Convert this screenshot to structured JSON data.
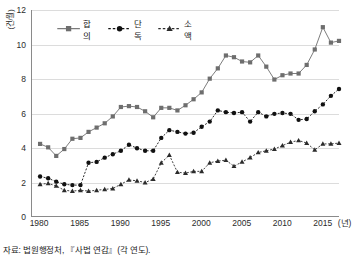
{
  "ylabel": "(건/월)",
  "source_note": "자료: 법원행정처, 『사법 연감』(각 연도).",
  "xunit": "(년)",
  "legend": {
    "items": [
      {
        "label": "합의",
        "color": "#6e6e6e",
        "marker": "square",
        "dash": "solid"
      },
      {
        "label": "단독",
        "color": "#111111",
        "marker": "circle",
        "dash": "dashed"
      },
      {
        "label": "소액",
        "color": "#2b2b2b",
        "marker": "triangle",
        "dash": "dashed"
      }
    ]
  },
  "axes": {
    "ytick_labels": [
      "12",
      "10",
      "8",
      "6",
      "4",
      "2",
      "0"
    ],
    "xtick_labels": [
      "1980",
      "1985",
      "1990",
      "1995",
      "2000",
      "2005",
      "2010",
      "2015"
    ]
  },
  "chart_data": {
    "type": "line",
    "title": "",
    "xlabel": "(년)",
    "ylabel": "(건/월)",
    "xlim": [
      1979,
      2017
    ],
    "ylim": [
      0,
      12
    ],
    "xticks": [
      1980,
      1985,
      1990,
      1995,
      2000,
      2005,
      2010,
      2015
    ],
    "yticks": [
      0,
      2,
      4,
      6,
      8,
      10,
      12
    ],
    "grid": "horizontal",
    "legend_position": "top-left-inside",
    "x": [
      1980,
      1981,
      1982,
      1983,
      1984,
      1985,
      1986,
      1987,
      1988,
      1989,
      1990,
      1991,
      1992,
      1993,
      1994,
      1995,
      1996,
      1997,
      1998,
      1999,
      2000,
      2001,
      2002,
      2003,
      2004,
      2005,
      2006,
      2007,
      2008,
      2009,
      2010,
      2011,
      2012,
      2013,
      2014,
      2015,
      2016,
      2017
    ],
    "series": [
      {
        "name": "합의",
        "color": "#6e6e6e",
        "marker": "square",
        "dash": "solid",
        "values": [
          4.2,
          4.0,
          3.5,
          3.9,
          4.5,
          4.55,
          4.9,
          5.15,
          5.4,
          5.8,
          6.35,
          6.4,
          6.35,
          6.1,
          5.75,
          6.3,
          6.3,
          6.15,
          6.45,
          6.8,
          7.2,
          8.0,
          8.6,
          9.35,
          9.25,
          9.0,
          8.95,
          9.35,
          8.7,
          7.95,
          8.2,
          8.3,
          8.3,
          8.8,
          9.7,
          11.0,
          10.1,
          10.2
        ]
      },
      {
        "name": "단독",
        "color": "#111111",
        "marker": "circle",
        "dash": "dashed",
        "values": [
          2.3,
          2.2,
          2.0,
          1.85,
          1.8,
          1.8,
          3.1,
          3.15,
          3.4,
          3.6,
          3.8,
          4.15,
          3.95,
          3.8,
          3.8,
          4.55,
          5.0,
          4.9,
          4.8,
          4.85,
          5.2,
          5.5,
          6.15,
          6.05,
          6.0,
          6.05,
          5.5,
          6.05,
          5.8,
          5.95,
          6.0,
          5.95,
          5.6,
          5.65,
          6.1,
          6.5,
          7.0,
          7.4
        ]
      },
      {
        "name": "소액",
        "color": "#2b2b2b",
        "marker": "triangle",
        "dash": "dashed",
        "values": [
          1.85,
          1.9,
          1.75,
          1.5,
          1.45,
          1.5,
          1.45,
          1.5,
          1.55,
          1.6,
          1.85,
          2.1,
          2.05,
          1.95,
          2.15,
          3.1,
          3.55,
          2.55,
          2.5,
          2.6,
          2.6,
          3.1,
          3.2,
          3.25,
          2.9,
          3.15,
          3.4,
          3.7,
          3.8,
          3.9,
          4.1,
          4.3,
          4.4,
          4.25,
          3.85,
          4.2,
          4.2,
          4.25
        ]
      }
    ]
  }
}
